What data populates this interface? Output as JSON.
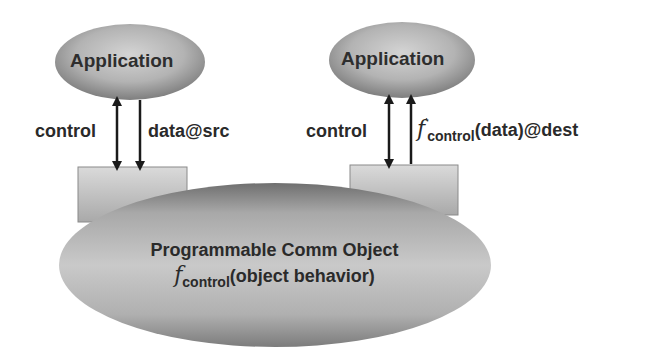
{
  "diagram": {
    "left_app": {
      "label": "Application"
    },
    "right_app": {
      "label": "Application"
    },
    "left_edge": {
      "control_label": "control",
      "data_label": "data@src"
    },
    "right_edge": {
      "control_label": "control",
      "fn_symbol": "f",
      "fn_prime": "′",
      "fn_subscript": "control",
      "data_label": "(data)@dest"
    },
    "comm_object": {
      "title": "Programmable Comm Object",
      "fn_symbol": "f",
      "fn_subscript": "control",
      "behavior_label": "(object behavior)"
    },
    "colors": {
      "ellipse_fill": "#b8b8b8",
      "ellipse_shadow": "#7a7a7a",
      "box_fill": "#d0d0d0",
      "arrow": "#1a1a1a",
      "text": "#2a2a2a"
    }
  }
}
